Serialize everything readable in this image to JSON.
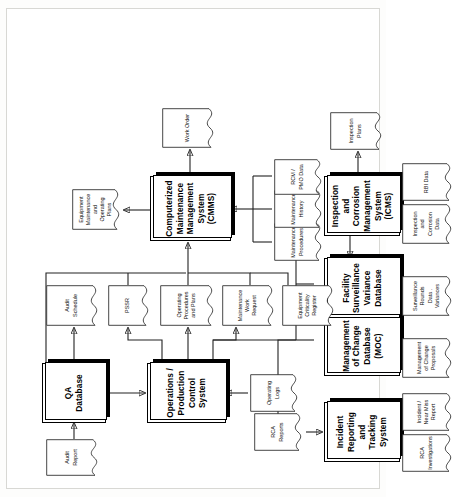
{
  "diagram": {
    "orientation": "rotated-90-ccw",
    "systems": [
      {
        "id": "qa",
        "label": "QA Database"
      },
      {
        "id": "ops",
        "label": "Operations / Production Control System"
      },
      {
        "id": "cmms",
        "label": "Computerized Maintenance Management System (CMMS)"
      },
      {
        "id": "irts",
        "label": "Incident Reporting and Tracking System"
      },
      {
        "id": "moc",
        "label": "Management of Change Database (MOC)"
      },
      {
        "id": "fsvd",
        "label": "Facility Surveillance Variance Database"
      },
      {
        "id": "icms",
        "label": "Inspection and Corrosion Management System (ICMS)"
      }
    ],
    "documents": [
      {
        "id": "audit-report",
        "label": "Audit Report"
      },
      {
        "id": "audit-schedule",
        "label": "Audit Schedule"
      },
      {
        "id": "pssr",
        "label": "PSSR"
      },
      {
        "id": "operating-procs",
        "label": "Operating Procedures and Plans"
      },
      {
        "id": "maint-work-request",
        "label": "Maintenance Work Request"
      },
      {
        "id": "equip-criticality",
        "label": "Equipment Criticality Register"
      },
      {
        "id": "operating-logs",
        "label": "Operating Logs"
      },
      {
        "id": "rca-reports",
        "label": "RCA Reports"
      },
      {
        "id": "equip-maint-plans",
        "label": "Equipment Maintenance and Operating Plans"
      },
      {
        "id": "work-order",
        "label": "Work Order"
      },
      {
        "id": "maint-procedures",
        "label": "Maintenance Procedures"
      },
      {
        "id": "maint-history",
        "label": "Maintenance History"
      },
      {
        "id": "rcm-pmo-data",
        "label": "RCM / PMO Data"
      },
      {
        "id": "inspection-plans",
        "label": "Inspection Plans"
      },
      {
        "id": "rca-investigations",
        "label": "RCA Investigations"
      },
      {
        "id": "incident-near-miss",
        "label": "Incident / Near Miss Report"
      },
      {
        "id": "moc-proposals",
        "label": "Management of Change Proposals"
      },
      {
        "id": "surveillance-data",
        "label": "Surveillance Rounds Data . Variances"
      },
      {
        "id": "inspection-corr",
        "label": "Inspection and Corrosion Data"
      },
      {
        "id": "rbi-data",
        "label": "RBI Data"
      }
    ],
    "colors": {
      "line": "#3a3a3a",
      "box_fill": "#ffffff",
      "shadow": "#000000",
      "text": "#000000"
    }
  }
}
